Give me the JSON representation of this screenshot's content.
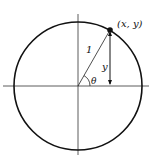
{
  "diagram": {
    "type": "unit-circle",
    "labels": {
      "point": "(x, y)",
      "radius": "1",
      "height": "y",
      "angle": "θ"
    },
    "colors": {
      "stroke": "#111111",
      "background": "#ffffff"
    }
  }
}
